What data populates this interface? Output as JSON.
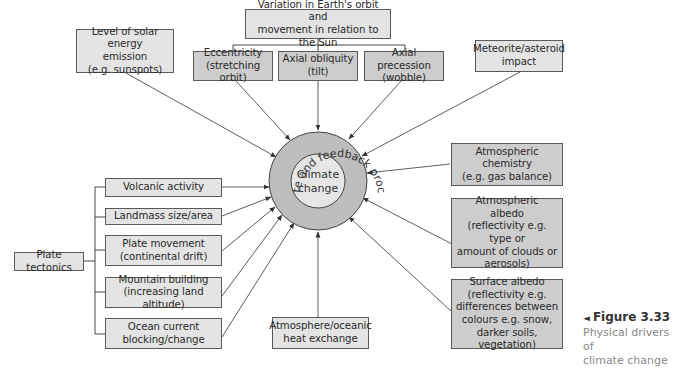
{
  "diagram": {
    "center": {
      "inner_label": "Climate\nchange",
      "inner_line1": "Climate",
      "inner_line2": "change",
      "ring_label": "Climate and feedback processes",
      "ring_color": "#bdbdbd",
      "inner_color": "#e6e6e6"
    },
    "orbit_group": {
      "parent": "Variation in Earth's orbit and\nmovement in relation to the Sun",
      "children": [
        "Eccentricity\n(stretching orbit)",
        "Axial obliquity\n(tilt)",
        "Axial precession\n(wobble)"
      ]
    },
    "solar": "Level of solar energy\nemission\n(e.g. sunspots)",
    "meteorite": "Meteorite/asteroid\nimpact",
    "plate_group": {
      "parent": "Plate tectonics",
      "children": [
        "Volcanic activity",
        "Landmass size/area",
        "Plate movement\n(continental drift)",
        "Mountain building\n(increasing land altitude)",
        "Ocean current\nblocking/change"
      ]
    },
    "atmos_exchange": "Atmosphere/oceanic\nheat exchange",
    "right_boxes": [
      "Atmospheric\nchemistry\n(e.g. gas balance)",
      "Atmospheric\nalbedo\n(reflectivity e.g. type or\namount of clouds or\naerosols)",
      "Surface albedo\n(reflectivity e.g.\ndifferences between\ncolours e.g. snow,\ndarker soils, vegetation)"
    ],
    "colors": {
      "light_box": "#e4e4e4",
      "dark_box": "#cdcdcd",
      "border": "#5a5a5a",
      "line": "#333333"
    }
  },
  "caption": {
    "marker": "◄",
    "figure": "Figure 3.33",
    "description": "Physical drivers of\nclimate change"
  }
}
